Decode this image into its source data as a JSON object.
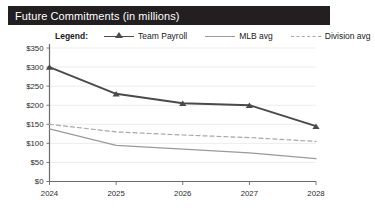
{
  "card": {
    "title": "Future Commitments (in millions)",
    "title_bar_color": "#231f20",
    "title_text_color": "#ffffff",
    "background": "#ffffff"
  },
  "legend": {
    "label": "Legend:",
    "entries": [
      {
        "name": "Team Payroll",
        "marker": "triangle-line",
        "color": "#4a4a4a",
        "style": "solid"
      },
      {
        "name": "MLB avg",
        "marker": "line",
        "color": "#9a9a9a",
        "style": "solid"
      },
      {
        "name": "Division avg",
        "marker": "dashed-line",
        "color": "#a8a8a8",
        "style": "dashed"
      }
    ]
  },
  "axes": {
    "y_ticks": [
      "$0",
      "$50",
      "$100",
      "$150",
      "$200",
      "$250",
      "$300",
      "$350"
    ],
    "x_ticks": [
      "2024",
      "2025",
      "2026",
      "2027",
      "2028"
    ],
    "axis_color": "#6b6b6b",
    "gridline_color": "#ededed"
  },
  "chart_data": {
    "type": "line",
    "title": "Future Commitments (in millions)",
    "xlabel": "",
    "ylabel": "",
    "x": [
      "2024",
      "2025",
      "2026",
      "2027",
      "2028"
    ],
    "ylim": [
      0,
      350
    ],
    "ytick_step": 50,
    "ytick_labels": [
      "$0",
      "$50",
      "$100",
      "$150",
      "$200",
      "$250",
      "$300",
      "$350"
    ],
    "grid": true,
    "grid_axis": "y",
    "legend_position": "top",
    "series": [
      {
        "name": "Team Payroll",
        "values": [
          300,
          230,
          205,
          200,
          145
        ],
        "color": "#4a4a4a",
        "style": "solid",
        "marker": "triangle"
      },
      {
        "name": "MLB avg",
        "values": [
          138,
          95,
          85,
          75,
          60
        ],
        "color": "#9a9a9a",
        "style": "solid",
        "marker": "none"
      },
      {
        "name": "Division avg",
        "values": [
          150,
          130,
          122,
          115,
          105
        ],
        "color": "#a8a8a8",
        "style": "dashed",
        "marker": "none"
      }
    ]
  }
}
